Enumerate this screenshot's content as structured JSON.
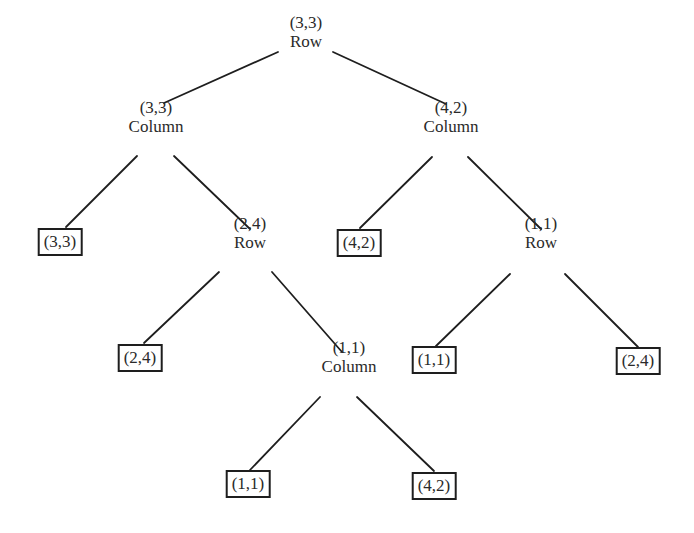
{
  "diagram": {
    "type": "game-tree",
    "nodes": [
      {
        "id": "root",
        "payoff": "(3,3)",
        "player": "Row",
        "x": 306,
        "y": 32
      },
      {
        "id": "n1",
        "payoff": "(3,3)",
        "player": "Column",
        "x": 156,
        "y": 117
      },
      {
        "id": "n2",
        "payoff": "(4,2)",
        "player": "Column",
        "x": 451,
        "y": 117
      },
      {
        "id": "n3",
        "payoff": "(2,4)",
        "player": "Row",
        "x": 250,
        "y": 233
      },
      {
        "id": "n4",
        "payoff": "(1,1)",
        "player": "Row",
        "x": 541,
        "y": 233
      },
      {
        "id": "n5",
        "payoff": "(1,1)",
        "player": "Column",
        "x": 349,
        "y": 357
      }
    ],
    "leaves": [
      {
        "id": "l1",
        "payoff": "(3,3)",
        "x": 60,
        "y": 228
      },
      {
        "id": "l2",
        "payoff": "(4,2)",
        "x": 359,
        "y": 229
      },
      {
        "id": "l3",
        "payoff": "(2,4)",
        "x": 140,
        "y": 344
      },
      {
        "id": "l4",
        "payoff": "(1,1)",
        "x": 434,
        "y": 346
      },
      {
        "id": "l5",
        "payoff": "(2,4)",
        "x": 638,
        "y": 347
      },
      {
        "id": "l6",
        "payoff": "(1,1)",
        "x": 248,
        "y": 470
      },
      {
        "id": "l7",
        "payoff": "(4,2)",
        "x": 434,
        "y": 472
      }
    ],
    "edges": [
      {
        "from": "root",
        "to": "n1",
        "x1": 278,
        "y1": 52,
        "x2": 164,
        "y2": 103
      },
      {
        "from": "root",
        "to": "n2",
        "x1": 333,
        "y1": 52,
        "x2": 446,
        "y2": 104
      },
      {
        "from": "n1",
        "to": "l1",
        "x1": 137,
        "y1": 156,
        "x2": 66,
        "y2": 227
      },
      {
        "from": "n1",
        "to": "n3",
        "x1": 174,
        "y1": 156,
        "x2": 250,
        "y2": 229
      },
      {
        "from": "n2",
        "to": "l2",
        "x1": 432,
        "y1": 157,
        "x2": 360,
        "y2": 228
      },
      {
        "from": "n2",
        "to": "n4",
        "x1": 468,
        "y1": 157,
        "x2": 541,
        "y2": 229
      },
      {
        "from": "n3",
        "to": "l3",
        "x1": 219,
        "y1": 272,
        "x2": 144,
        "y2": 343
      },
      {
        "from": "n3",
        "to": "n5",
        "x1": 272,
        "y1": 272,
        "x2": 342,
        "y2": 352
      },
      {
        "from": "n4",
        "to": "l4",
        "x1": 510,
        "y1": 274,
        "x2": 436,
        "y2": 346
      },
      {
        "from": "n4",
        "to": "l5",
        "x1": 565,
        "y1": 274,
        "x2": 638,
        "y2": 347
      },
      {
        "from": "n5",
        "to": "l6",
        "x1": 320,
        "y1": 397,
        "x2": 250,
        "y2": 470
      },
      {
        "from": "n5",
        "to": "l7",
        "x1": 357,
        "y1": 397,
        "x2": 434,
        "y2": 471
      }
    ]
  }
}
